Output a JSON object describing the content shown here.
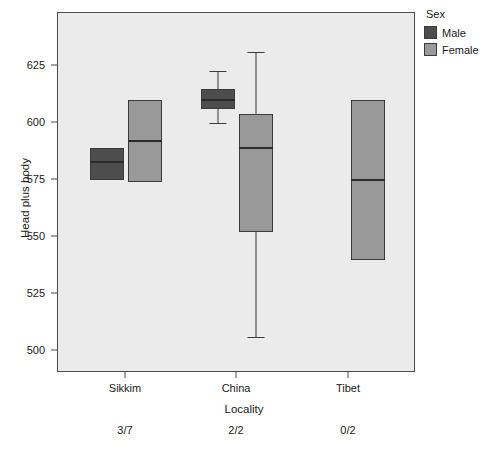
{
  "chart_data": {
    "type": "box",
    "title": "",
    "xlabel": "Locality",
    "ylabel": "Head plus body",
    "ylim": [
      495,
      640
    ],
    "yticks": [
      500,
      525,
      550,
      575,
      600,
      625
    ],
    "ytick_labels": [
      "500",
      "525",
      "550",
      "575",
      "600",
      "625"
    ],
    "categories": [
      "Sikkim",
      "China",
      "Tibet"
    ],
    "category_notes": [
      "3/7",
      "2/2",
      "0/2"
    ],
    "grid": false,
    "legend": {
      "title": "Sex",
      "position": "right-top",
      "entries": [
        {
          "label": "Male",
          "color": "#4d4d4d"
        },
        {
          "label": "Female",
          "color": "#999999"
        }
      ]
    },
    "series": [
      {
        "name": "Male",
        "color": "#4d4d4d",
        "boxes": [
          {
            "category": "Sikkim",
            "lower_whisker": null,
            "q1": 575.0,
            "median": 583.0,
            "q3": 589.0,
            "upper_whisker": null
          },
          {
            "category": "China",
            "lower_whisker": 600.0,
            "q1": 606.0,
            "median": 610.0,
            "q3": 615.0,
            "upper_whisker": 623.0
          },
          {
            "category": "Tibet",
            "lower_whisker": null,
            "q1": null,
            "median": null,
            "q3": null,
            "upper_whisker": null
          }
        ]
      },
      {
        "name": "Female",
        "color": "#999999",
        "boxes": [
          {
            "category": "Sikkim",
            "lower_whisker": null,
            "q1": 574.0,
            "median": 592.0,
            "q3": 610.0,
            "upper_whisker": null
          },
          {
            "category": "China",
            "lower_whisker": 506.0,
            "q1": 552.0,
            "median": 589.0,
            "q3": 604.0,
            "upper_whisker": 631.0
          },
          {
            "category": "Tibet",
            "lower_whisker": null,
            "q1": 540.0,
            "median": 575.0,
            "q3": 610.0,
            "upper_whisker": null
          }
        ]
      }
    ]
  }
}
